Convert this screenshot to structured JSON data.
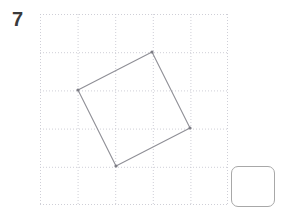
{
  "page": {
    "background_color": "#ffffff"
  },
  "question": {
    "number_label": "7"
  },
  "grid": {
    "name": "dotted-grid-canvas",
    "x": 40,
    "y": 14,
    "width": 188,
    "height": 191,
    "columns": 5,
    "rows": 5,
    "cell_width": 37.6,
    "cell_height": 38.2,
    "line_style": "dotted",
    "line_color": "#c9c9d2",
    "dot_spacing": 2
  },
  "shape": {
    "name": "rotated-square",
    "type": "polygon",
    "stroke_color": "#8f8f96",
    "stroke_width": 1.1,
    "fill": "none",
    "vertex_marker_color": "#7d7d85",
    "vertex_marker_radius": 1.6,
    "vertices": [
      {
        "label": "top",
        "x": 152,
        "y": 52
      },
      {
        "label": "right",
        "x": 190,
        "y": 128
      },
      {
        "label": "bottom",
        "x": 116,
        "y": 166
      },
      {
        "label": "left",
        "x": 78,
        "y": 90
      }
    ]
  },
  "tool_button": {
    "name": "blank-tool-button",
    "label": "",
    "x": 231,
    "y": 166,
    "width": 44,
    "height": 41,
    "border_color": "#a8a8a8",
    "border_radius": 7,
    "fill_color": "#ffffff"
  }
}
